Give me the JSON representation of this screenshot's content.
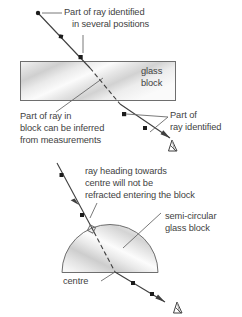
{
  "figure": {
    "background_color": "#ffffff",
    "ink_color": "#3f3f3f",
    "block_fill_light": "#f2f2f2",
    "block_fill_mid": "#d9d9d9",
    "block_stroke": "#6e6e6e"
  },
  "top_diagram": {
    "name": "rectangular-glass-block-refraction",
    "block_label_line1": "glass",
    "block_label_line2": "block",
    "callout_incident": {
      "line1": "Part of ray identified",
      "line2": "in several positions"
    },
    "callout_internal": {
      "line1": "Part of ray in",
      "line2": "block can be inferred",
      "line3": "from measurements"
    },
    "callout_emergent": {
      "line1": "Part of",
      "line2": "ray identified"
    },
    "marker_icon": "pin-marker-icon",
    "ray_point_count": 6
  },
  "bottom_diagram": {
    "name": "semicircular-glass-block-refraction",
    "callout_centre_ray": {
      "line1": "ray heading towards",
      "line2": "centre will not be",
      "line3": "refracted entering the block"
    },
    "callout_block": {
      "line1": "semi-circular",
      "line2": "glass block"
    },
    "centre_label": "centre",
    "marker_icon": "pin-marker-icon",
    "ray_point_count": 5
  }
}
